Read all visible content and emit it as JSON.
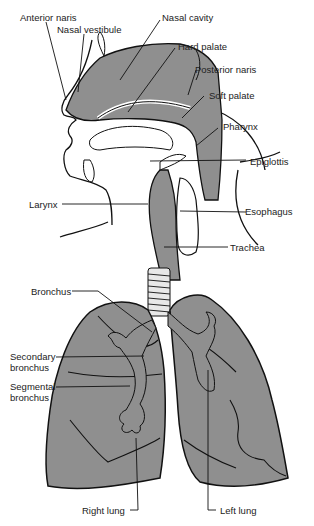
{
  "diagram": {
    "type": "anatomical-illustration",
    "caption_clipped": "",
    "colors": {
      "tissue": "#8f8f8f",
      "outline": "#111111",
      "background": "#ffffff"
    },
    "labels": {
      "anterior_naris": "Anterior naris",
      "nasal_vestibule": "Nasal vestibule",
      "nasal_cavity": "Nasal cavity",
      "hard_palate": "Hard palate",
      "posterior_naris": "Posterior naris",
      "soft_palate": "Soft palate",
      "pharynx": "Pharynx",
      "epiglottis": "Epiglottis",
      "larynx": "Larynx",
      "esophagus": "Esophagus",
      "trachea": "Trachea",
      "bronchus": "Bronchus",
      "secondary_bronchus_1": "Secondary",
      "secondary_bronchus_2": "bronchus",
      "segmental_bronchus_1": "Segmental",
      "segmental_bronchus_2": "bronchus",
      "right_lung": "Right lung",
      "left_lung": "Left lung"
    }
  }
}
